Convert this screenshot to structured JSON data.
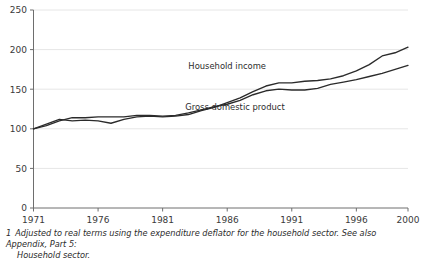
{
  "chart_data": {
    "type": "line",
    "title": "",
    "xlabel": "",
    "ylabel": "",
    "xlim": [
      1971,
      2000
    ],
    "ylim": [
      0,
      250
    ],
    "yticks": [
      0,
      50,
      100,
      150,
      200,
      250
    ],
    "xticks": [
      1971,
      1976,
      1981,
      1986,
      1991,
      1996,
      2000
    ],
    "grid": true,
    "legend_position": "inline-annotation",
    "x": [
      1971,
      1972,
      1973,
      1974,
      1975,
      1976,
      1977,
      1978,
      1979,
      1980,
      1981,
      1982,
      1983,
      1984,
      1985,
      1986,
      1987,
      1988,
      1989,
      1990,
      1991,
      1992,
      1993,
      1994,
      1995,
      1996,
      1997,
      1998,
      1999,
      2000
    ],
    "series": [
      {
        "name": "Household income",
        "color": "#2b2b2b",
        "values": [
          100,
          106,
          112,
          110,
          111,
          110,
          107,
          112,
          115,
          116,
          115,
          116,
          118,
          123,
          127,
          133,
          139,
          147,
          154,
          158,
          158,
          160,
          161,
          163,
          167,
          173,
          181,
          192,
          196,
          203
        ]
      },
      {
        "name": "Gross domestic product",
        "color": "#2b2b2b",
        "values": [
          100,
          104,
          110,
          114,
          114,
          115,
          115,
          115,
          117,
          117,
          116,
          117,
          120,
          124,
          128,
          131,
          136,
          143,
          148,
          150,
          149,
          149,
          151,
          156,
          159,
          162,
          166,
          170,
          175,
          180
        ]
      }
    ],
    "annotations": [
      {
        "text": "Household income",
        "x": 1986.0,
        "y": 176
      },
      {
        "text": "Gross domestic product",
        "x": 1986.6,
        "y": 124
      }
    ]
  },
  "footnote": {
    "number": "1",
    "line1": "Adjusted to real terms using the expenditure deflator for the household sector. See also Appendix, Part 5:",
    "line2": "Household sector."
  },
  "colors": {
    "line": "#2b2b2b",
    "axis": "#6e6e6e",
    "grid": "#e6e6e6",
    "text": "#2b2b2b"
  }
}
